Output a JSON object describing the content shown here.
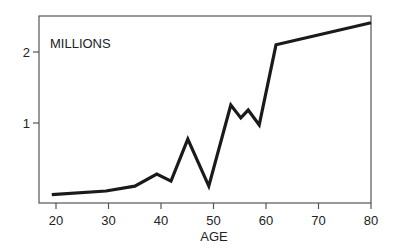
{
  "chart_data": {
    "type": "line",
    "title": "",
    "annotation": "MILLIONS",
    "xlabel": "AGE",
    "ylabel": "MILLIONS",
    "xlim": [
      18,
      80
    ],
    "ylim": [
      -0.1,
      2.5
    ],
    "x_ticks": [
      20,
      30,
      40,
      50,
      60,
      70,
      80
    ],
    "y_ticks": [
      1,
      2
    ],
    "grid": false,
    "legend": null,
    "series": [
      {
        "name": "MILLIONS",
        "color": "#1a1a1a",
        "x": [
          19.2,
          29.5,
          35.0,
          39.2,
          41.9,
          45.1,
          49.1,
          53.3,
          55.2,
          56.6,
          58.7,
          61.9,
          80.0
        ],
        "values": [
          0.02,
          0.07,
          0.14,
          0.31,
          0.21,
          0.8,
          0.14,
          1.28,
          1.1,
          1.21,
          1.0,
          2.13,
          2.44
        ]
      }
    ]
  },
  "labels": {
    "annotation": "MILLIONS",
    "xlabel": "AGE",
    "x_ticks": [
      "20",
      "30",
      "40",
      "50",
      "60",
      "70",
      "80"
    ],
    "y_ticks": [
      "1",
      "2"
    ]
  }
}
